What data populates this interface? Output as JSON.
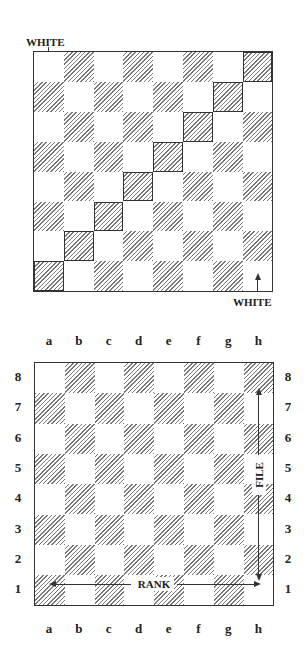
{
  "top_diagram": {
    "label_top_left": "WHITE",
    "label_bottom_right": "WHITE",
    "highlighted_diagonal": [
      "a1",
      "b2",
      "c3",
      "d4",
      "e5",
      "f6",
      "g7",
      "h8"
    ],
    "board_orientation_note": "Arrows indicate White's side at both top-left and bottom-right corners"
  },
  "bottom_diagram": {
    "files": [
      "a",
      "b",
      "c",
      "d",
      "e",
      "f",
      "g",
      "h"
    ],
    "ranks": [
      "8",
      "7",
      "6",
      "5",
      "4",
      "3",
      "2",
      "1"
    ],
    "rank_label": "RANK",
    "file_label": "FILE"
  },
  "colors": {
    "border": "#333333",
    "hatch": "#7a7a7a",
    "light_square": "#ffffff"
  }
}
